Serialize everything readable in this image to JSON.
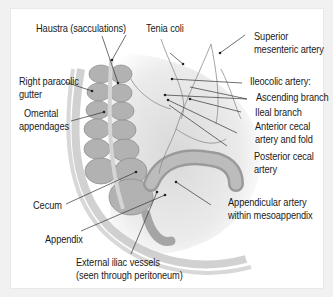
{
  "figure": {
    "labels": {
      "haustra": "Haustra (sacculations)",
      "tenia_coli": "Tenia coli",
      "superior_mesenteric_1": "Superior",
      "superior_mesenteric_2": "mesenteric artery",
      "right_paracolic_1": "Right paracolic",
      "right_paracolic_2": "gutter",
      "ileocolic": "Ileocolic artery:",
      "ascending_branch": "Ascending branch",
      "omental_1": "Omental",
      "omental_2": "appendages",
      "ileal_branch": "Ileal branch",
      "anterior_cecal_1": "Anterior cecal",
      "anterior_cecal_2": "artery and fold",
      "posterior_cecal_1": "Posterior cecal",
      "posterior_cecal_2": "artery",
      "cecum": "Cecum",
      "appendicular_1": "Appendicular artery",
      "appendicular_2": "within mesoappendix",
      "appendix": "Appendix",
      "external_iliac_1": "External iliac vessels",
      "external_iliac_2": "(seen through peritoneum)"
    }
  }
}
